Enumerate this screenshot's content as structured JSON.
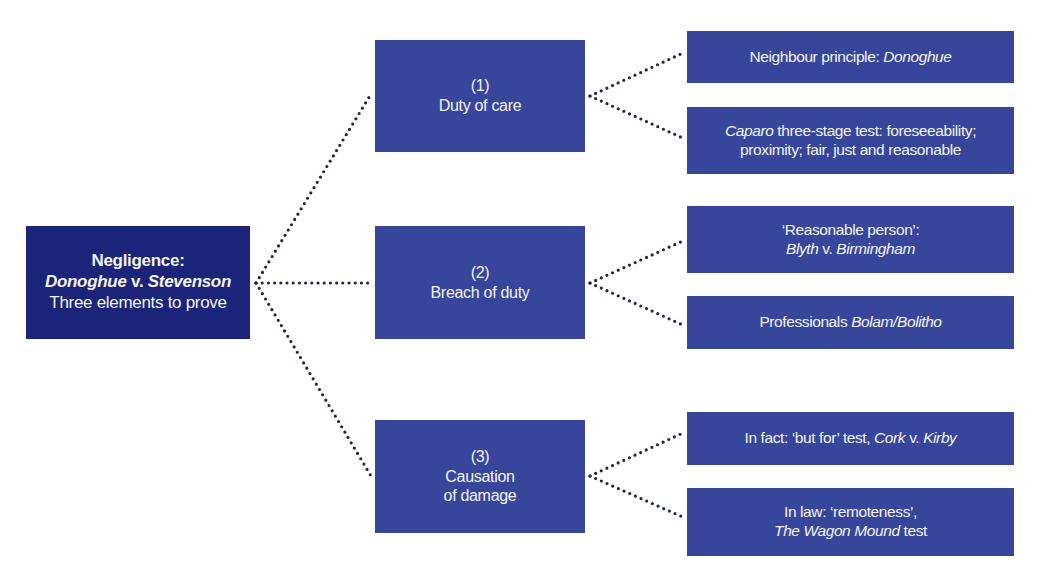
{
  "colors": {
    "root_box": "#1b2478",
    "branch_box": "#37469b",
    "text": "#f2f3f8",
    "connector": "#1e2550",
    "background": "#ffffff"
  },
  "root": {
    "title": "Negligence:",
    "case_part1": "Donoghue",
    "case_v": " v. ",
    "case_part2": "Stevenson",
    "subtitle": "Three elements to prove"
  },
  "elements": [
    {
      "number": "(1)",
      "label_line1": "Duty of care",
      "label_line2": "",
      "details": [
        {
          "line1_plain": "Neighbour principle: ",
          "line1_italic": "Donoghue",
          "line2_plain": "",
          "line2_italic": ""
        },
        {
          "line1_italic": "Caparo",
          "line1_plain": " three-stage test: foreseeability;",
          "line2_plain": "proximity; fair, just and reasonable"
        }
      ]
    },
    {
      "number": "(2)",
      "label_line1": "Breach of duty",
      "label_line2": "",
      "details": [
        {
          "line1_plain": "‘Reasonable person’:",
          "line2_italic_a": "Blyth",
          "line2_plain": " v. ",
          "line2_italic_b": "Birmingham"
        },
        {
          "line1_plain": "Professionals ",
          "line1_italic": "Bolam/Bolitho"
        }
      ]
    },
    {
      "number": "(3)",
      "label_line1": "Causation",
      "label_line2": "of damage",
      "details": [
        {
          "line1_plain": "In fact: ‘but for’ test, ",
          "line1_italic_a": "Cork",
          "line1_plain_b": " v. ",
          "line1_italic_b": "Kirby"
        },
        {
          "line1_plain": "In law: ‘remoteness’,",
          "line2_italic": "The Wagon Mound",
          "line2_plain": " test"
        }
      ]
    }
  ]
}
